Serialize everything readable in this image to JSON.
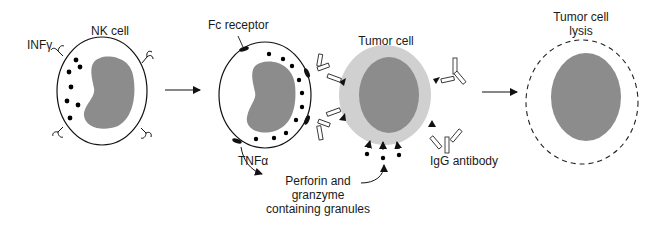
{
  "diagram": {
    "type": "biological-process",
    "colors": {
      "outline": "#111111",
      "nucleus": "#8c8c8c",
      "tumor_cytoplasm": "#d0d0d0",
      "granule": "#000000",
      "background": "#ffffff"
    },
    "stages": [
      {
        "id": "nk-cell",
        "label": "NK cell"
      },
      {
        "id": "adcc",
        "label": "Tumor cell"
      },
      {
        "id": "lysis",
        "label": "Tumor cell lysis"
      }
    ],
    "labels": {
      "nk_cell": "NK cell",
      "inf_gamma": "INFγ",
      "fc_receptor": "Fc receptor",
      "tnf_alpha": "TNFα",
      "tumor_cell": "Tumor cell",
      "igg_antibody": "IgG antibody",
      "perforin_line1": "Perforin and",
      "perforin_line2": "granzyme",
      "perforin_line3": "containing granules",
      "lysis_line1": "Tumor cell",
      "lysis_line2": "lysis"
    },
    "arrows": [
      {
        "from": "nk-cell",
        "to": "adcc"
      },
      {
        "from": "adcc",
        "to": "lysis"
      }
    ]
  }
}
